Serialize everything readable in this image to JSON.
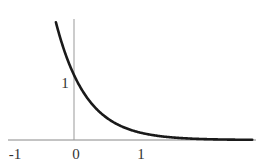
{
  "chart_data": {
    "type": "line",
    "title": "",
    "xlabel": "",
    "ylabel": "",
    "function": "y = e^(-2.2x)",
    "xlim": [
      -1.0,
      2.7
    ],
    "ylim": [
      0,
      1.86
    ],
    "grid": false,
    "legend": null,
    "x_ticks": [
      {
        "value": -1,
        "label": "-1"
      },
      {
        "value": 0,
        "label": "0"
      },
      {
        "value": 1,
        "label": "1"
      }
    ],
    "y_ticks": [
      {
        "value": 1,
        "label": "1"
      }
    ],
    "series": [
      {
        "name": "exponential-decay",
        "color": "#1a1a1a",
        "x": [
          -0.27,
          -0.2,
          -0.1,
          0,
          0.1,
          0.2,
          0.3,
          0.4,
          0.5,
          0.6,
          0.8,
          1.0,
          1.2,
          1.4,
          1.6,
          2.0,
          2.4,
          2.65
        ],
        "y": [
          1.81,
          1.55,
          1.25,
          1.0,
          0.8,
          0.64,
          0.52,
          0.41,
          0.33,
          0.27,
          0.17,
          0.11,
          0.07,
          0.05,
          0.03,
          0.01,
          0.005,
          0.003
        ]
      }
    ]
  },
  "axes": {
    "color": "#888888",
    "curve_color": "#1a1a1a"
  }
}
